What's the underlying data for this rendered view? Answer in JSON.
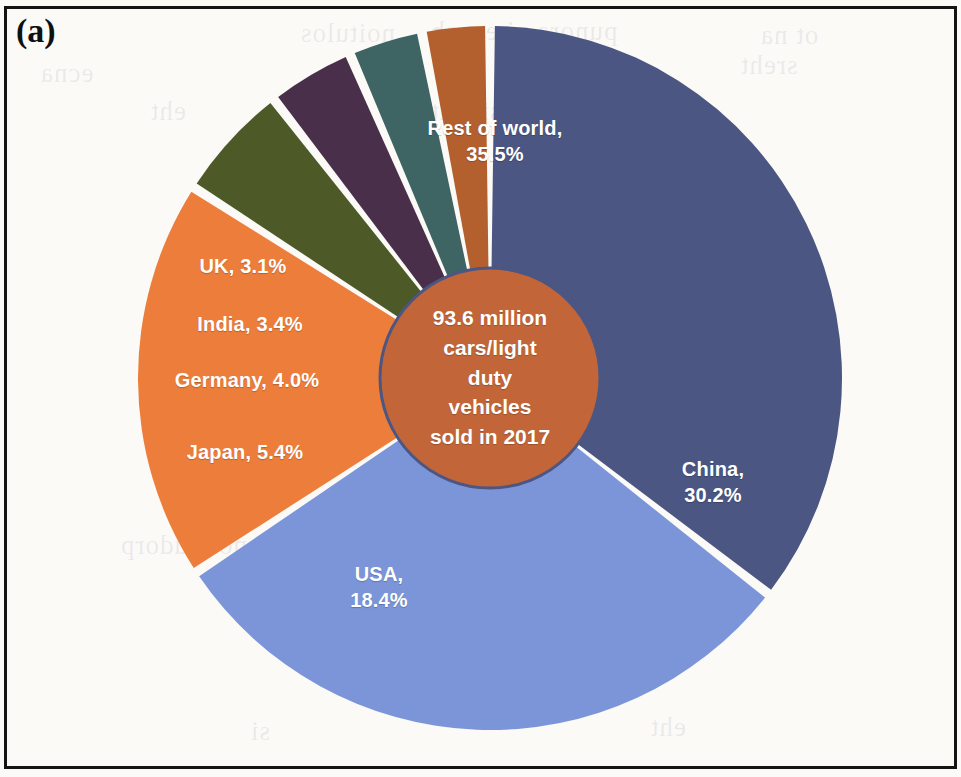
{
  "figure": {
    "panel_label": "(a)",
    "background_color": "#fbfaf6",
    "border_color": "#141414"
  },
  "center_note": {
    "text": "93.6 million\ncars/light\nduty\nvehicles\nsold in 2017",
    "fill_color": "#C2663A",
    "stroke_color": "#4B5683",
    "text_color": "#ffffff"
  },
  "bleed_through": [
    {
      "text": "noitulos",
      "x": 300,
      "y": 18
    },
    {
      "text": "punora ni ecnab",
      "x": 430,
      "y": 16
    },
    {
      "text": "ot na",
      "x": 760,
      "y": 20
    },
    {
      "text": "noitpo",
      "x": 545,
      "y": 52
    },
    {
      "text": "sreht",
      "x": 740,
      "y": 50
    },
    {
      "text": "ecna",
      "x": 40,
      "y": 58
    },
    {
      "text": "eht",
      "x": 150,
      "y": 96
    },
    {
      "text": "si siht",
      "x": 430,
      "y": 96
    },
    {
      "text": "dna",
      "x": 260,
      "y": 140
    },
    {
      "text": "elcihev",
      "x": 170,
      "y": 486
    },
    {
      "text": "eht fo",
      "x": 330,
      "y": 486
    },
    {
      "text": "CV",
      "x": 480,
      "y": 486
    },
    {
      "text": "noitcudorp",
      "x": 120,
      "y": 530
    },
    {
      "text": "si",
      "x": 250,
      "y": 716
    },
    {
      "text": "eht",
      "x": 650,
      "y": 712
    }
  ],
  "chart_data": {
    "type": "pie",
    "title": "93.6 million cars/light duty vehicles sold in 2017",
    "subtitle": "",
    "xlabel": "",
    "ylabel": "",
    "donut": true,
    "total_label": "93.6 million",
    "year": "2017",
    "units": "percent of global cars/light duty vehicles sold",
    "legend_position": "none (labels drawn on slices)",
    "grid": false,
    "start_angle_deg": 0,
    "direction": "clockwise",
    "categories": [
      "Rest of world",
      "China",
      "USA",
      "Japan",
      "Germany",
      "India",
      "UK"
    ],
    "values": [
      35.5,
      30.2,
      18.4,
      5.4,
      4.0,
      3.4,
      3.1
    ],
    "colors": [
      "#4B5683",
      "#7B95D8",
      "#ED7D3A",
      "#4D5A28",
      "#4A2F4A",
      "#3E6464",
      "#B4602E"
    ],
    "slices": [
      {
        "name": "Rest of world",
        "value": 35.5,
        "label": "Rest of world,\n35.5%",
        "color": "#4B5683",
        "label_x": 495,
        "label_y": 141
      },
      {
        "name": "China",
        "value": 30.2,
        "label": "China,\n30.2%",
        "color": "#7B95D8",
        "label_x": 713,
        "label_y": 482
      },
      {
        "name": "USA",
        "value": 18.4,
        "label": "USA,\n18.4%",
        "color": "#ED7D3A",
        "label_x": 379,
        "label_y": 587
      },
      {
        "name": "Japan",
        "value": 5.4,
        "label": "Japan, 5.4%",
        "color": "#4D5A28",
        "label_x": 245,
        "label_y": 452
      },
      {
        "name": "Germany",
        "value": 4.0,
        "label": "Germany, 4.0%",
        "color": "#4A2F4A",
        "label_x": 247,
        "label_y": 380
      },
      {
        "name": "India",
        "value": 3.4,
        "label": "India, 3.4%",
        "color": "#3E6464",
        "label_x": 250,
        "label_y": 324
      },
      {
        "name": "UK",
        "value": 3.1,
        "label": "UK, 3.1%",
        "color": "#B4602E",
        "label_x": 243,
        "label_y": 266
      }
    ]
  },
  "geometry": {
    "center_x": 490,
    "center_y": 378,
    "outer_radius": 352,
    "inner_radius": 110,
    "gap_degrees": 1.6
  }
}
